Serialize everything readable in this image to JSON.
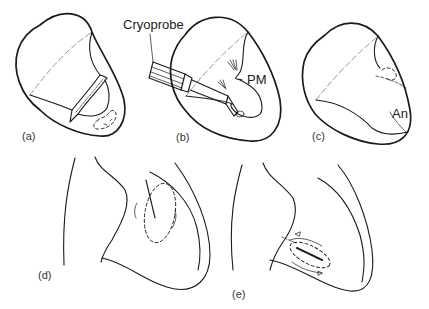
{
  "figure": {
    "panels": [
      {
        "id": "a",
        "label": "(a)"
      },
      {
        "id": "b",
        "label": "(b)",
        "annotations": [
          "Cryoprobe",
          "PM"
        ]
      },
      {
        "id": "c",
        "label": "(c)",
        "annotations": [
          "An"
        ]
      },
      {
        "id": "d",
        "label": "(d)"
      },
      {
        "id": "e",
        "label": "(e)"
      }
    ]
  },
  "labels": {
    "a": "(a)",
    "b": "(b)",
    "c": "(c)",
    "d": "(d)",
    "e": "(e)",
    "cryoprobe": "Cryoprobe",
    "pm": "PM",
    "an": "An"
  }
}
